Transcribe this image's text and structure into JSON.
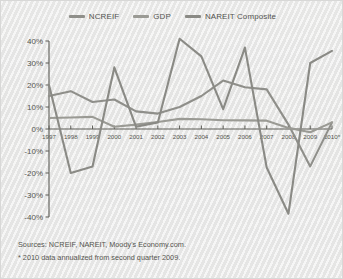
{
  "chart_data": {
    "type": "line",
    "title": "",
    "subtitle": "",
    "xlabel": "",
    "ylabel": "",
    "x": [
      "1997",
      "1998",
      "1999",
      "2000",
      "2001",
      "2002",
      "2003",
      "2004",
      "2005",
      "2006",
      "2007",
      "2008",
      "2009",
      "2010*"
    ],
    "xlim": [
      "1997",
      "2010*"
    ],
    "ylim": [
      -40,
      40
    ],
    "ytick_values": [
      40,
      30,
      20,
      10,
      0,
      -10,
      -20,
      -30,
      -40
    ],
    "ytick_labels": [
      "40%",
      "30%",
      "20%",
      "10%",
      "0%",
      "-10%",
      "-20%",
      "-30%",
      "-40%"
    ],
    "grid": false,
    "legend_position": "top-center",
    "series": [
      {
        "name": "NCREIF",
        "color": "#8f8f8a",
        "values": [
          15.0,
          17.2,
          12.3,
          13.4,
          8.0,
          7.0,
          10.0,
          15.0,
          22.0,
          19.0,
          18.0,
          2.0,
          -17.0,
          3.0
        ]
      },
      {
        "name": "GDP",
        "color": "#9a9a94",
        "values": [
          5.0,
          5.2,
          5.5,
          1.0,
          2.0,
          3.2,
          4.6,
          4.4,
          4.0,
          3.9,
          3.8,
          0.5,
          -1.5,
          3.0
        ]
      },
      {
        "name": "NAREIT Composite",
        "color": "#8a8a85",
        "values": [
          20.0,
          -20.0,
          -17.0,
          28.0,
          1.0,
          3.0,
          41.0,
          33.0,
          9.0,
          37.0,
          -17.5,
          -38.5,
          30.0,
          35.5
        ]
      }
    ]
  },
  "legend": {
    "items": [
      {
        "label": "NCREIF",
        "color": "#8f8f8a",
        "swatch_name": "legend-swatch-ncreif"
      },
      {
        "label": "GDP",
        "color": "#9a9a94",
        "swatch_name": "legend-swatch-gdp"
      },
      {
        "label": "NAREIT Composite",
        "color": "#8a8a85",
        "swatch_name": "legend-swatch-nareit"
      }
    ]
  },
  "notes": {
    "sources": "Sources:  NCREIF, NAREIT, Moody's Economy.com.",
    "footnote": "* 2010 data annualized from second quarter 2009."
  },
  "colors": {
    "axis": "#5c5c56",
    "text": "#55554f",
    "background": "#eaeae9"
  }
}
